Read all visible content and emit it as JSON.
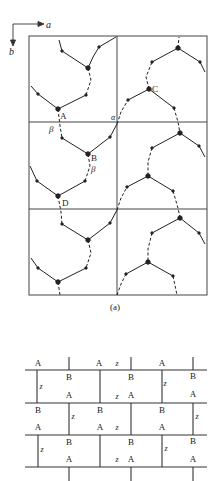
{
  "axes": {
    "a_label": "a",
    "b_label": "b"
  },
  "panel_a": {
    "caption": "(a)",
    "cell_labels": {
      "A": "A",
      "B": "B",
      "C": "C",
      "D": "D",
      "beta1": "β",
      "beta2": "β",
      "alpha": "α"
    },
    "grid": {
      "columns": 2,
      "rows": 3
    }
  },
  "panel_b": {
    "rows": [
      {
        "top": [
          "A",
          "A",
          "A"
        ],
        "bottom": [
          "B",
          "B",
          "B"
        ],
        "z_labels": [
          "z",
          "z",
          "z"
        ]
      }
    ],
    "labels": [
      {
        "t": "A",
        "x": 38,
        "y": 366
      },
      {
        "t": "A",
        "x": 99,
        "y": 366
      },
      {
        "t": "z",
        "x": 117,
        "y": 366
      },
      {
        "t": "A",
        "x": 162,
        "y": 366
      },
      {
        "t": "z",
        "x": 41,
        "y": 389
      },
      {
        "t": "B",
        "x": 69,
        "y": 380
      },
      {
        "t": "B",
        "x": 131,
        "y": 380
      },
      {
        "t": "z",
        "x": 165,
        "y": 386
      },
      {
        "t": "B",
        "x": 193,
        "y": 379
      },
      {
        "t": "A",
        "x": 69,
        "y": 398
      },
      {
        "t": "z",
        "x": 117,
        "y": 399
      },
      {
        "t": "A",
        "x": 131,
        "y": 398
      },
      {
        "t": "A",
        "x": 193,
        "y": 397
      },
      {
        "t": "B",
        "x": 38,
        "y": 413
      },
      {
        "t": "B",
        "x": 100,
        "y": 413
      },
      {
        "t": "B",
        "x": 162,
        "y": 413
      },
      {
        "t": "z",
        "x": 73,
        "y": 419
      },
      {
        "t": "z",
        "x": 197,
        "y": 419
      },
      {
        "t": "A",
        "x": 38,
        "y": 430
      },
      {
        "t": "A",
        "x": 100,
        "y": 430
      },
      {
        "t": "z",
        "x": 117,
        "y": 430
      },
      {
        "t": "A",
        "x": 162,
        "y": 430
      },
      {
        "t": "B",
        "x": 69,
        "y": 445
      },
      {
        "t": "B",
        "x": 131,
        "y": 445
      },
      {
        "t": "B",
        "x": 193,
        "y": 444
      },
      {
        "t": "z",
        "x": 42,
        "y": 452
      },
      {
        "t": "z",
        "x": 166,
        "y": 451
      },
      {
        "t": "A",
        "x": 69,
        "y": 462
      },
      {
        "t": "z",
        "x": 117,
        "y": 462
      },
      {
        "t": "A",
        "x": 131,
        "y": 462
      },
      {
        "t": "A",
        "x": 193,
        "y": 462
      }
    ]
  }
}
